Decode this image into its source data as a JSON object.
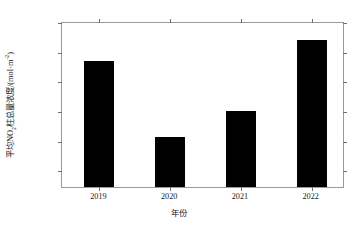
{
  "chart_data": {
    "type": "bar",
    "title": "",
    "subtitle": "",
    "categories": [
      "2019",
      "2020",
      "2021",
      "2022"
    ],
    "values": [
      10.65,
      8.1,
      8.95,
      11.35
    ],
    "value_scale_exponent": -5,
    "value_unit": "mol·m⁻²",
    "series": [
      {
        "name": "平均NO₂柱总量浓度",
        "values": [
          10.65,
          8.1,
          8.95,
          11.35
        ]
      }
    ],
    "xlabel": "年份",
    "ylabel": "平均NO₂柱总量浓度/(mol·m⁻²)",
    "ylim": [
      6.4,
      12.0
    ],
    "yticks": [
      7,
      8,
      9,
      10,
      11,
      12
    ],
    "ytick_labels": [
      "7×10⁻⁵",
      "8×10⁻⁵",
      "9×10⁻⁵",
      "10×10⁻⁵",
      "11×10⁻⁵",
      "12×10⁻⁵"
    ],
    "grid": false,
    "legend": "none",
    "bar_color": "#000000",
    "axis_color": "#9a9a9a",
    "background_color": "#ffffff"
  },
  "axis": {
    "y_title_prefix": "平均NO",
    "y_title_sub": "2",
    "y_title_mid": "柱总量浓度/(mol·m",
    "y_title_sup": "-2",
    "y_title_suffix": ")",
    "x_title": "年份"
  },
  "ytick_mantissas": [
    "12",
    "11",
    "10",
    "9",
    "8",
    "7"
  ],
  "ytick_exponent": "-5",
  "ytick_base": "×10"
}
